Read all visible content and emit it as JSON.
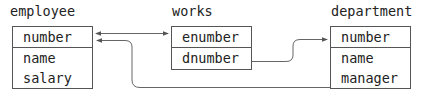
{
  "tables": {
    "employee": {
      "title": "employee",
      "fields": [
        "number",
        "name",
        "salary"
      ]
    },
    "works": {
      "title": "works",
      "fields": [
        "enumber",
        "dnumber"
      ]
    },
    "department": {
      "title": "department",
      "fields": [
        "number",
        "name",
        "manager"
      ]
    }
  },
  "relationships": [
    {
      "from": "employee.number",
      "to": "works.enumber",
      "style": "bidirectional-arrow"
    },
    {
      "from": "works.dnumber",
      "to": "department.number",
      "style": "arrow"
    },
    {
      "from": "department.manager",
      "to": "employee.number",
      "style": "arrow"
    }
  ],
  "colors": {
    "line": "#555555",
    "text": "#222222",
    "background": "#ffffff"
  }
}
